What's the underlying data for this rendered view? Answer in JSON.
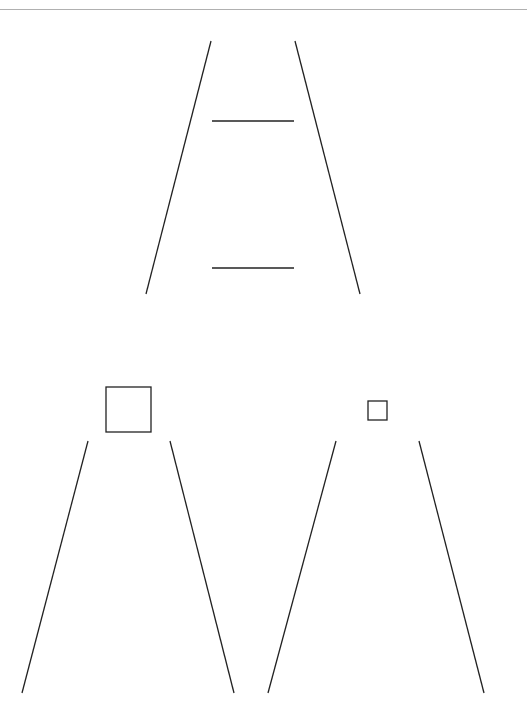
{
  "header": {
    "label": ""
  },
  "colors": {
    "stroke": "#222222",
    "rule": "#b0b0b0",
    "background": "#ffffff"
  },
  "figures": [
    {
      "name": "ladder",
      "lines": [
        {
          "x1": 211,
          "y1": 41,
          "x2": 146,
          "y2": 294
        },
        {
          "x1": 295,
          "y1": 41,
          "x2": 360,
          "y2": 294
        },
        {
          "x1": 212,
          "y1": 121,
          "x2": 294,
          "y2": 121
        },
        {
          "x1": 212,
          "y1": 268,
          "x2": 294,
          "y2": 268
        }
      ]
    },
    {
      "name": "trapezoid-with-large-square",
      "square": {
        "x": 106,
        "y": 387,
        "size": 45
      },
      "lines": [
        {
          "x1": 88,
          "y1": 441,
          "x2": 22,
          "y2": 693
        },
        {
          "x1": 170,
          "y1": 441,
          "x2": 234,
          "y2": 693
        }
      ]
    },
    {
      "name": "trapezoid-with-small-square",
      "square": {
        "x": 368,
        "y": 401,
        "size": 19
      },
      "lines": [
        {
          "x1": 336,
          "y1": 441,
          "x2": 268,
          "y2": 693
        },
        {
          "x1": 419,
          "y1": 441,
          "x2": 484,
          "y2": 693
        }
      ]
    }
  ]
}
